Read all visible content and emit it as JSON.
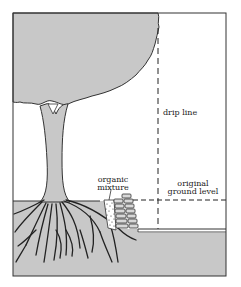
{
  "diagram": {
    "title": "",
    "labels": {
      "drip_line": "drip line",
      "organic_line1": "organic",
      "organic_line2": "mixture",
      "ground_line1": "original",
      "ground_line2": "ground level"
    },
    "colors": {
      "fill_gray": "#c8c8c8",
      "stroke": "#333333",
      "background": "#ffffff"
    },
    "elements": [
      "tree-canopy",
      "tree-trunk",
      "root-system",
      "stone-retaining-wall",
      "organic-mixture",
      "drip-line",
      "original-ground-level-line",
      "lowered-ground"
    ]
  }
}
